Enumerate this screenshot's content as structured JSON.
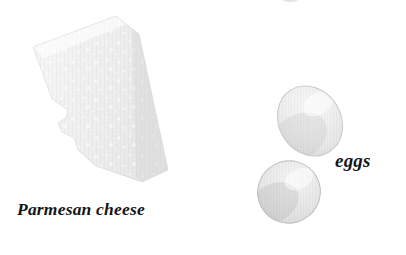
{
  "scene": {
    "width": 406,
    "height": 255,
    "background_color": "#ffffff",
    "kind": "food-ingredient-illustration"
  },
  "labels": {
    "parmesan": "Parmesan cheese",
    "eggs": "eggs"
  },
  "objects": [
    {
      "name": "parmesan-cheese-wedge",
      "label": "Parmesan cheese",
      "shape": "irregular-polygon-wedge",
      "fill_color": "#eeeeee",
      "shade_color": "#dcdcdc",
      "highlight_color": "#fbfbfb",
      "bounds": {
        "x": 32,
        "y": 15,
        "width": 137,
        "height": 168
      }
    },
    {
      "name": "egg-upper",
      "label": "eggs",
      "shape": "ellipse",
      "fill_color": "#ececec",
      "shade_color": "#c9c9c9",
      "highlight_color": "#fafafa",
      "center": {
        "x": 310,
        "y": 121
      },
      "size": {
        "width": 62,
        "height": 73
      },
      "rotation_deg": -32
    },
    {
      "name": "egg-lower",
      "label": "eggs",
      "shape": "ellipse",
      "fill_color": "#e4e4e4",
      "shade_color": "#bcbcbc",
      "highlight_color": "#f6f6f6",
      "center": {
        "x": 289,
        "y": 192
      },
      "size": {
        "width": 63,
        "height": 62
      },
      "rotation_deg": -28
    }
  ],
  "colors": {
    "background": "#ffffff",
    "text": "#151515",
    "cheese_fill": "#eeeeee",
    "egg_fill": "#ececec",
    "egg_shadow": "#c9c9c9"
  }
}
